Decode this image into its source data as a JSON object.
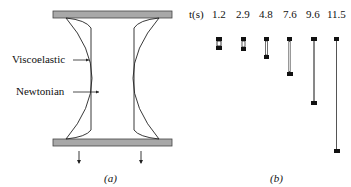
{
  "panel_a": {
    "labels": {
      "viscoelastic": "Viscoelastic",
      "newtonian": "Newtonian"
    },
    "caption": "(a)",
    "plate_color": "#a8a8a8"
  },
  "panel_b": {
    "time_label": "t(s)",
    "times": [
      "1.2",
      "2.9",
      "4.8",
      "7.6",
      "9.6",
      "11.5"
    ],
    "caption": "(b)"
  }
}
